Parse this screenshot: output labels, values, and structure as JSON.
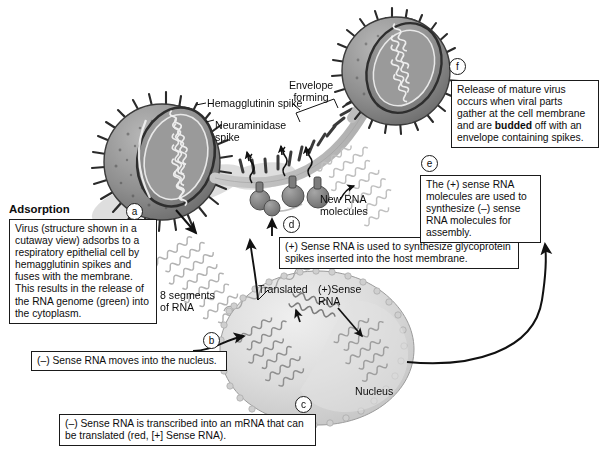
{
  "figure": {
    "background_color": "#ffffff",
    "ink_color": "#0d0d0d"
  },
  "labels": {
    "adsorption_heading": "Adsorption",
    "hemagglutinin_spike": "Hemagglutinin spike",
    "neuraminidase_spike": "Neuraminidase\nspike",
    "envelope_forming": "Envelope\nforming",
    "new_rna_molecules": "New RNA\nmolecules",
    "eight_segments_of_rna": "8 segments\nof RNA",
    "translated": "Translated",
    "plus_sense_rna": "(+)Sense\nRNA",
    "nucleus": "Nucleus"
  },
  "markers": {
    "a": "a",
    "b": "b",
    "c": "c",
    "d": "d",
    "e": "e",
    "f": "f"
  },
  "callouts": {
    "a": "Virus (structure shown in a cutaway view) adsorbs to a respiratory epithelial cell by hemagglutinin spikes and fuses with the membrane. This results in the release of the RNA genome (green) into the cytoplasm.",
    "b": "(–) Sense RNA moves into the nucleus.",
    "c": "(–) Sense RNA is transcribed into an mRNA that can be translated (red, [+] Sense RNA).",
    "d": "(+) Sense RNA is used to synthesize glycoprotein spikes inserted into the host membrane.",
    "e": "The (+) sense RNA molecules are used to synthesize (–) sense RNA molecules for assembly.",
    "f_part1": "Release of mature virus occurs when viral parts gather at the cell membrane and are ",
    "f_bold": "budded",
    "f_part2": " off with an envelope containing spikes."
  },
  "structures": {
    "virus_adsorbing": "influenza-virion-cutaway",
    "virus_mature": "influenza-virion-mature",
    "host_cell": "respiratory-epithelial-cell",
    "cell_nucleus": "nucleus",
    "membrane_budding": "budding-membrane",
    "ribosome_cluster": "glycoprotein-spike-assembly",
    "rna_segments_free": "8-rna-segments",
    "rna_new": "new-rna-molecules"
  }
}
